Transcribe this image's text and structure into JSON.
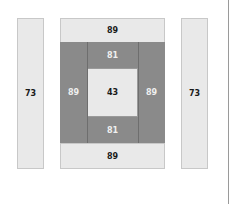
{
  "diagram": {
    "left_strip": {
      "value": "73"
    },
    "right_strip": {
      "value": "73"
    },
    "top_band": {
      "value": "89"
    },
    "bottom_band": {
      "value": "89"
    },
    "left_frame": {
      "value": "89"
    },
    "right_frame": {
      "value": "89"
    },
    "top_inner": {
      "value": "81"
    },
    "bottom_inner": {
      "value": "81"
    },
    "center": {
      "value": "43"
    }
  },
  "colors": {
    "light": "#e9e9e9",
    "dark": "#8a8a8a",
    "border": "#c8c8c8"
  }
}
